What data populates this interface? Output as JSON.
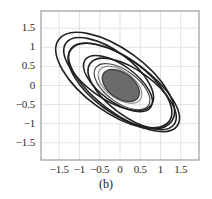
{
  "figure": {
    "caption": "(b)",
    "background_color": "#ffffff"
  },
  "chart_data": {
    "type": "line",
    "title": "",
    "subtitle": "",
    "xlabel": "",
    "ylabel": "",
    "xlim": [
      -1.95,
      1.95
    ],
    "ylim": [
      -1.95,
      1.95
    ],
    "grid": true,
    "grid_color": "#dcdcdc",
    "frame_color": "#8a8a8a",
    "curve_color": "#231f20",
    "fill_color": "#6b6b6b",
    "legend": null,
    "legend_position": "none",
    "xticks": [
      -1.5,
      -1,
      -0.5,
      0,
      0.5,
      1,
      1.5
    ],
    "xtick_labels": [
      "−1.5",
      "−1",
      "−0.5",
      "0",
      "0.5",
      "1",
      "1.5"
    ],
    "yticks": [
      1.5,
      1,
      0.5,
      0,
      -0.5,
      -1,
      -1.5
    ],
    "ytick_labels": [
      "1.5",
      "1",
      "0.5",
      "0",
      "−0.5",
      "−1",
      "−1.5"
    ],
    "annotations": [],
    "series": [
      {
        "name": "ellipse-1",
        "shape": "ellipse",
        "cx": -0.12,
        "cy": 0.13,
        "rx": 1.72,
        "ry": 0.82,
        "rotation_deg": -36,
        "filled": false,
        "stroke": "#231f20",
        "stroke_width": 1.6
      },
      {
        "name": "ellipse-2",
        "shape": "ellipse",
        "cx": 0.1,
        "cy": -0.05,
        "rx": 1.62,
        "ry": 0.7,
        "rotation_deg": -36,
        "filled": false,
        "stroke": "#231f20",
        "stroke_width": 1.6
      },
      {
        "name": "ellipse-3",
        "shape": "ellipse",
        "cx": -0.28,
        "cy": 0.3,
        "rx": 1.3,
        "ry": 0.62,
        "rotation_deg": -36,
        "filled": false,
        "stroke": "#231f20",
        "stroke_width": 1.6
      },
      {
        "name": "ellipse-4",
        "shape": "ellipse",
        "cx": 0.3,
        "cy": -0.22,
        "rx": 1.28,
        "ry": 0.6,
        "rotation_deg": -36,
        "filled": false,
        "stroke": "#231f20",
        "stroke_width": 1.6
      },
      {
        "name": "ellipse-5",
        "shape": "ellipse",
        "cx": 0.0,
        "cy": 0.0,
        "rx": 1.5,
        "ry": 0.72,
        "rotation_deg": -36,
        "filled": false,
        "stroke": "#231f20",
        "stroke_width": 1.6
      },
      {
        "name": "ellipse-6",
        "shape": "ellipse",
        "cx": -0.05,
        "cy": 0.05,
        "rx": 1.0,
        "ry": 0.48,
        "rotation_deg": -36,
        "filled": false,
        "stroke": "#231f20",
        "stroke_width": 1.5
      },
      {
        "name": "ellipse-7",
        "shape": "ellipse",
        "cx": 0.05,
        "cy": -0.03,
        "rx": 0.8,
        "ry": 0.42,
        "rotation_deg": -36,
        "filled": false,
        "stroke": "#4a4a4a",
        "stroke_width": 1.2
      },
      {
        "name": "ellipse-8",
        "shape": "ellipse",
        "cx": 0.0,
        "cy": 0.02,
        "rx": 0.62,
        "ry": 0.36,
        "rotation_deg": -36,
        "filled": false,
        "stroke": "#7a7a7a",
        "stroke_width": 1.0
      },
      {
        "name": "ellipse-core-filled",
        "shape": "ellipse",
        "cx": 0.02,
        "cy": 0.0,
        "rx": 0.52,
        "ry": 0.33,
        "rotation_deg": -36,
        "filled": true,
        "fill": "#6b6b6b",
        "stroke": "#3a3a3a",
        "stroke_width": 1.2
      }
    ]
  }
}
